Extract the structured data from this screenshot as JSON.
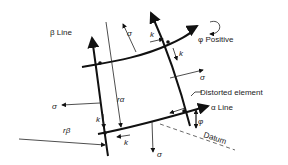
{
  "diagram": {
    "labels": {
      "beta_line": "β Line",
      "alpha_line": "α Line",
      "phi_positive": "φ Positive",
      "distorted_element": "Distorted element",
      "datum": "Datum",
      "phi": "φ",
      "r_alpha": "rα",
      "r_beta": "rβ",
      "sigma": "σ",
      "k": "k"
    }
  }
}
